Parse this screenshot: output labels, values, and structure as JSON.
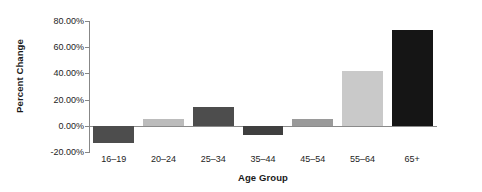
{
  "chart_data": {
    "type": "bar",
    "title": "",
    "xlabel": "Age Group",
    "ylabel": "Percent Change",
    "categories": [
      "16–19",
      "20–24",
      "25–34",
      "35–44",
      "45–54",
      "55–64",
      "65+"
    ],
    "values": [
      -13.0,
      5.0,
      14.0,
      -7.0,
      5.5,
      41.5,
      73.0
    ],
    "value_labels": [
      "-13.00%",
      "5.00%",
      "14.00%",
      "-7.00%",
      "5.50%",
      "41.50%",
      "73.00%"
    ],
    "bar_colors": [
      "#4d4d4d",
      "#bcbcbc",
      "#4d4d4d",
      "#3f3f3f",
      "#9a9a9a",
      "#c9c9c9",
      "#151515"
    ],
    "ylim": [
      -20,
      80
    ],
    "yticks": [
      80,
      60,
      40,
      20,
      0,
      -20
    ],
    "ytick_labels": [
      "80.00%",
      "60.00%",
      "40.00%",
      "20.00%",
      "0.00%",
      "-20.00%"
    ],
    "grid": false,
    "legend": "none",
    "axis_color": "#878787",
    "text_color": "#1d1d1d"
  }
}
